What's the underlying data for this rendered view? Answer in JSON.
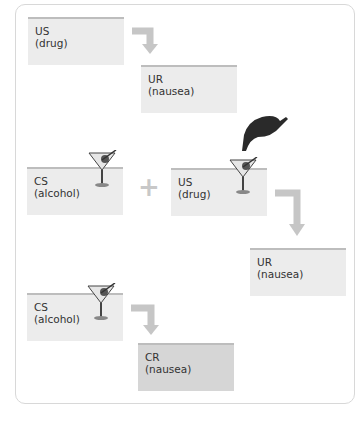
{
  "diagram": {
    "stages": [
      {
        "name": "before",
        "boxes": [
          {
            "label": "US",
            "sub": "(drug)"
          },
          {
            "label": "UR",
            "sub": "(nausea)"
          }
        ]
      },
      {
        "name": "during",
        "boxes": [
          {
            "label": "CS",
            "sub": "(alcohol)"
          },
          {
            "label": "US",
            "sub": "(drug)"
          },
          {
            "label": "UR",
            "sub": "(nausea)"
          }
        ],
        "operator": "+"
      },
      {
        "name": "after",
        "boxes": [
          {
            "label": "CS",
            "sub": "(alcohol)"
          },
          {
            "label": "CR",
            "sub": "(nausea)"
          }
        ]
      }
    ],
    "colors": {
      "box": "#ececec",
      "box_cr": "#d6d6d6",
      "accent_line": "#bdbdbd",
      "arrow": "#c6c6c6"
    }
  }
}
